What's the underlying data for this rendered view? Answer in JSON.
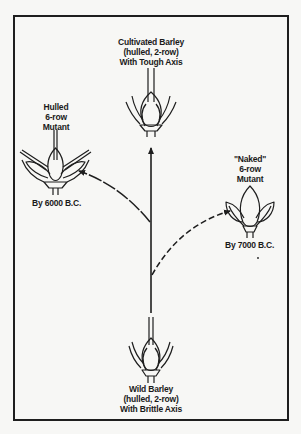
{
  "diagram": {
    "nodes": {
      "cultivated": {
        "lines": [
          "Cultivated Barley",
          "(hulled, 2-row)",
          "With Tough Axis"
        ]
      },
      "hulled_mutant": {
        "lines": [
          "Hulled",
          "6-row",
          "Mutant"
        ],
        "date": "By 6000 B.C."
      },
      "naked_mutant": {
        "lines": [
          "\"Naked\"",
          "6-row",
          "Mutant"
        ],
        "date": "By 7000 B.C."
      },
      "wild": {
        "lines": [
          "Wild Barley",
          "(hulled, 2-row)",
          "With Brittle Axis"
        ]
      }
    },
    "edges": [
      {
        "from": "wild",
        "to": "cultivated",
        "style": "solid"
      },
      {
        "from": "wild",
        "to": "hulled_mutant",
        "style": "dashed"
      },
      {
        "from": "wild",
        "to": "naked_mutant",
        "style": "dashed"
      }
    ],
    "colors": {
      "ink": "#1e1e1e",
      "paper": "#f7f7f5"
    }
  }
}
